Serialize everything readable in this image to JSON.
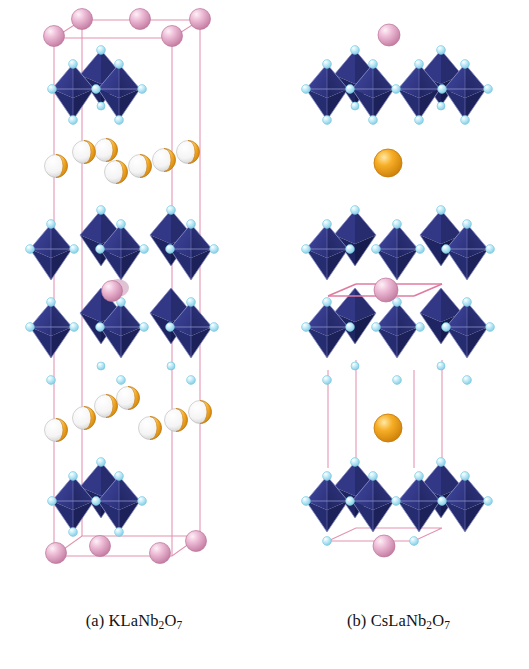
{
  "figure": {
    "type": "crystal-structure-diagram",
    "background": "#ffffff",
    "width": 529,
    "height": 669,
    "panel_count": 2
  },
  "captions": {
    "a": {
      "marker": "(a)",
      "formula_plain": "KLaNb2O7",
      "parts": [
        {
          "t": "KLaNb",
          "sub": false
        },
        {
          "t": "2",
          "sub": true
        },
        {
          "t": "O",
          "sub": false
        },
        {
          "t": "7",
          "sub": true
        }
      ]
    },
    "b": {
      "marker": "(b)",
      "formula_plain": "CsLaNb2O7",
      "parts": [
        {
          "t": "CsLaNb",
          "sub": false
        },
        {
          "t": "2",
          "sub": true
        },
        {
          "t": "O",
          "sub": false
        },
        {
          "t": "7",
          "sub": true
        }
      ]
    }
  },
  "palette": {
    "octahedron_face_light": "#3b3f93",
    "octahedron_face_mid": "#2f3482",
    "octahedron_face_dark": "#232a6b",
    "octahedron_face_darkest": "#1b2059",
    "octahedron_edge": "#8d93c9",
    "oxygen": "#b4e8f7",
    "oxygen_rim": "#6fc6de",
    "lanthanum": "#dfa3c4",
    "lanthanum_rim": "#b9749c",
    "lanthanum_highlight": "#f6e2ee",
    "alkali_orange": "#f3a01c",
    "alkali_orange_rim": "#c47708",
    "alkali_vacancy": "#f2f2f2",
    "alkali_vacancy_rim": "#b9b9b9",
    "unit_cell_line": "#e291ae",
    "unit_cell_line_strong": "#df7ba0",
    "caption_text": "#141414"
  },
  "species": {
    "oxygen": {
      "label": "O",
      "color": "#b4e8f7",
      "role": "octahedron vertex"
    },
    "niobium": {
      "label": "Nb",
      "color": "#2f3482",
      "role": "octahedron centre (NbO6)"
    },
    "lanthanum": {
      "label": "La",
      "color": "#dfa3c4",
      "role": "A-site inside perovskite block / cell corners"
    },
    "potassium": {
      "label": "K",
      "color": "#f3a01c",
      "role": "interlayer cation, partially occupied (orange/white split spheres)"
    },
    "caesium": {
      "label": "Cs",
      "color": "#f3a01c",
      "role": "interlayer cation, fully occupied single orange sphere"
    }
  },
  "panel_a": {
    "id": "panel-a",
    "compound": "KLaNb2O7",
    "interlayer_cation": "K",
    "interlayer_occupancy": "partial",
    "unit_cell_visible": true,
    "octahedra_rows": [
      {
        "name": "top-partial-slab",
        "y": 88,
        "count": 2
      },
      {
        "name": "upper-slab-row-1",
        "y": 250,
        "count": 2
      },
      {
        "name": "upper-slab-row-2",
        "y": 330,
        "count": 2
      },
      {
        "name": "bottom-partial-slab",
        "y": 500,
        "count": 2
      }
    ],
    "interlayer_rows": [
      {
        "name": "upper-K-row",
        "y": 158,
        "spheres": 7
      },
      {
        "name": "lower-K-row",
        "y": 420,
        "spheres": 7
      }
    ],
    "lanthanum_sites": [
      {
        "name": "top-corners",
        "y": 22,
        "count": 5
      },
      {
        "name": "mid-block",
        "y": 290,
        "count": 1
      },
      {
        "name": "bottom-corners",
        "y": 548,
        "count": 4
      }
    ]
  },
  "panel_b": {
    "id": "panel-b",
    "compound": "CsLaNb2O7",
    "interlayer_cation": "Cs",
    "interlayer_occupancy": "full",
    "unit_cell_visible": true,
    "octahedra_rows": [
      {
        "name": "top-partial-slab",
        "y": 88,
        "count": 2
      },
      {
        "name": "middle-slab-row-1",
        "y": 250,
        "count": 2
      },
      {
        "name": "middle-slab-row-2",
        "y": 330,
        "count": 2
      },
      {
        "name": "bottom-partial-slab",
        "y": 500,
        "count": 2
      }
    ],
    "interlayer_spheres": [
      {
        "name": "upper-Cs",
        "x": 160,
        "y": 38,
        "r": 13
      },
      {
        "name": "middle-Cs",
        "x": 128,
        "y": 158,
        "r": 14
      },
      {
        "name": "lower-Cs",
        "x": 128,
        "y": 425,
        "r": 14
      }
    ],
    "lanthanum_sites": [
      {
        "name": "mid-block",
        "y": 290,
        "count": 1
      },
      {
        "name": "bottom-centre",
        "y": 540,
        "count": 1
      }
    ]
  }
}
